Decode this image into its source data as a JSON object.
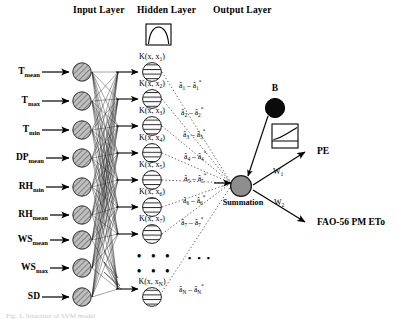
{
  "figure": {
    "caption_partial": "Fig. 1. Structure of SVM model"
  },
  "headers": {
    "input": "Input Layer",
    "hidden": "Hidden Layer",
    "output": "Output Layer"
  },
  "input_layer": {
    "nodes": [
      {
        "label": "T",
        "sub": "mean",
        "y": 72
      },
      {
        "label": "T",
        "sub": "max",
        "y": 101
      },
      {
        "label": "T",
        "sub": "min",
        "y": 130
      },
      {
        "label": "DP",
        "sub": "mean",
        "y": 158
      },
      {
        "label": "RH",
        "sub": "min",
        "y": 187
      },
      {
        "label": "RH",
        "sub": "mean",
        "y": 215
      },
      {
        "label": "WS",
        "sub": "mean",
        "y": 240
      },
      {
        "label": "WS",
        "sub": "max",
        "y": 268
      },
      {
        "label": "SD",
        "sub": "",
        "y": 297
      }
    ],
    "node_fill": "#b5b5b5",
    "node_style": "hatched-circle"
  },
  "hidden_layer": {
    "kernel_icon_name": "kernel-function-box",
    "nodes": [
      {
        "label": "K(x, x",
        "sub": "1",
        "tail": ")",
        "y": 72
      },
      {
        "label": "K(x, x",
        "sub": "2",
        "tail": ")",
        "y": 99
      },
      {
        "label": "K(x, x",
        "sub": "3",
        "tail": ")",
        "y": 126
      },
      {
        "label": "K(x, x",
        "sub": "4",
        "tail": ")",
        "y": 153
      },
      {
        "label": "K(x, x",
        "sub": "5",
        "tail": ")",
        "y": 180
      },
      {
        "label": "K(x, x",
        "sub": "6",
        "tail": ")",
        "y": 207
      },
      {
        "label": "K(x, x",
        "sub": "7",
        "tail": ")",
        "y": 234
      },
      {
        "label": "K(x, x",
        "sub": "N",
        "tail": ")",
        "y": 289
      }
    ],
    "node_fill": "#ffffff",
    "node_style": "striped-circle",
    "ellipsis": "• • •"
  },
  "weights": {
    "alphas": [
      {
        "sub": "1",
        "y": 85
      },
      {
        "sub": "2",
        "y": 112
      },
      {
        "sub": "3",
        "y": 134
      },
      {
        "sub": "4",
        "y": 156
      },
      {
        "sub": "5",
        "y": 178
      },
      {
        "sub": "6",
        "y": 200
      },
      {
        "sub": "7",
        "y": 222
      },
      {
        "sub": "N",
        "y": 289
      }
    ],
    "alpha_symbol": "â",
    "minus": "–",
    "star": "*"
  },
  "output_layer": {
    "bias_label": "B",
    "summation_label": "Summation",
    "transfer_icon_name": "transfer-function-box",
    "outputs": [
      {
        "weight": "W",
        "weight_sub": "1",
        "label": "PE"
      },
      {
        "weight": "W",
        "weight_sub": "2",
        "label": "FAO-56 PM ETo"
      }
    ],
    "bias_fill": "#000000",
    "summation_fill": "#8e8e8e"
  },
  "colors": {
    "background": "#ffffff",
    "stroke": "#000000",
    "input_node": "#b5b5b5",
    "summation_node": "#8e8e8e",
    "bias_node": "#000000",
    "dotted_line": "#555555"
  }
}
